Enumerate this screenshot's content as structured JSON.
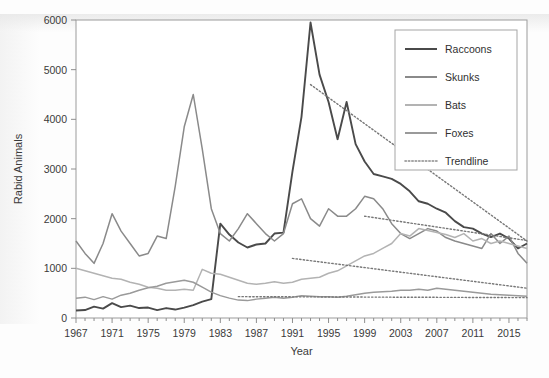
{
  "chart_data": {
    "type": "line",
    "title": "",
    "xlabel": "Year",
    "ylabel": "Rabid Animals",
    "xlim": [
      1967,
      2017
    ],
    "ylim": [
      0,
      6000
    ],
    "ytick_step": 1000,
    "xtick_step": 4,
    "grid": false,
    "legend_position": "top-right",
    "x": [
      1967,
      1968,
      1969,
      1970,
      1971,
      1972,
      1973,
      1974,
      1975,
      1976,
      1977,
      1978,
      1979,
      1980,
      1981,
      1982,
      1983,
      1984,
      1985,
      1986,
      1987,
      1988,
      1989,
      1990,
      1991,
      1992,
      1993,
      1994,
      1995,
      1996,
      1997,
      1998,
      1999,
      2000,
      2001,
      2002,
      2003,
      2004,
      2005,
      2006,
      2007,
      2008,
      2009,
      2010,
      2011,
      2012,
      2013,
      2014,
      2015,
      2016,
      2017
    ],
    "xticks": [
      1967,
      1971,
      1975,
      1979,
      1983,
      1987,
      1991,
      1995,
      1999,
      2003,
      2007,
      2011,
      2015
    ],
    "yticks": [
      0,
      1000,
      2000,
      3000,
      4000,
      5000,
      6000
    ],
    "series": [
      {
        "name": "Raccoons",
        "color": "#4a4a4a",
        "width": 1.9,
        "values": [
          150,
          160,
          230,
          190,
          300,
          220,
          250,
          200,
          210,
          160,
          200,
          170,
          210,
          260,
          330,
          380,
          1900,
          1680,
          1520,
          1420,
          1480,
          1500,
          1700,
          1720,
          2950,
          4050,
          5950,
          4900,
          4350,
          3600,
          4350,
          3500,
          3150,
          2900,
          2850,
          2800,
          2700,
          2550,
          2350,
          2300,
          2200,
          2120,
          1950,
          1830,
          1800,
          1700,
          1630,
          1700,
          1600,
          1400,
          1500
        ]
      },
      {
        "name": "Skunks",
        "color": "#8a8a8a",
        "width": 1.5,
        "values": [
          1550,
          1300,
          1100,
          1500,
          2100,
          1750,
          1500,
          1250,
          1300,
          1650,
          1600,
          2650,
          3850,
          4500,
          3400,
          2200,
          1700,
          1550,
          1800,
          2100,
          1900,
          1700,
          1550,
          1700,
          2300,
          2400,
          2000,
          1850,
          2200,
          2050,
          2050,
          2200,
          2450,
          2400,
          2200,
          1900,
          1700,
          1600,
          1700,
          1800,
          1750,
          1620,
          1550,
          1500,
          1450,
          1400,
          1700,
          1500,
          1650,
          1300,
          1100
        ]
      },
      {
        "name": "Bats",
        "color": "#b3b3b3",
        "width": 1.5,
        "values": [
          1000,
          950,
          900,
          850,
          800,
          780,
          720,
          680,
          620,
          600,
          560,
          560,
          580,
          560,
          980,
          900,
          880,
          820,
          760,
          700,
          680,
          700,
          730,
          700,
          720,
          780,
          800,
          820,
          900,
          950,
          1050,
          1150,
          1250,
          1300,
          1400,
          1500,
          1700,
          1650,
          1800,
          1760,
          1720,
          1680,
          1620,
          1700,
          1550,
          1600,
          1500,
          1550,
          1500,
          1450,
          1400
        ]
      },
      {
        "name": "Foxes",
        "color": "#9a9a9a",
        "width": 1.5,
        "values": [
          400,
          420,
          370,
          430,
          380,
          460,
          500,
          560,
          610,
          640,
          700,
          730,
          760,
          720,
          620,
          520,
          450,
          400,
          360,
          350,
          380,
          400,
          420,
          400,
          420,
          450,
          440,
          430,
          430,
          420,
          440,
          470,
          500,
          520,
          530,
          540,
          560,
          560,
          580,
          560,
          600,
          580,
          560,
          540,
          520,
          500,
          480,
          470,
          460,
          450,
          440
        ]
      }
    ],
    "trendlines": [
      {
        "for": "Raccoons",
        "x_start": 1993,
        "x_end": 2017,
        "y_start": 4700,
        "y_end": 1550
      },
      {
        "for": "Skunks",
        "x_start": 1999,
        "x_end": 2017,
        "y_start": 2050,
        "y_end": 1560
      },
      {
        "for": "Bats",
        "x_start": 1991,
        "x_end": 2017,
        "y_start": 1200,
        "y_end": 600
      },
      {
        "for": "Foxes",
        "x_start": 1985,
        "x_end": 2017,
        "y_start": 430,
        "y_end": 410
      }
    ],
    "legend": [
      {
        "label": "Raccoons",
        "color": "#4a4a4a",
        "style": "solid"
      },
      {
        "label": "Skunks",
        "color": "#8a8a8a",
        "style": "solid"
      },
      {
        "label": "Bats",
        "color": "#b3b3b3",
        "style": "solid"
      },
      {
        "label": "Foxes",
        "color": "#9a9a9a",
        "style": "solid"
      },
      {
        "label": "Trendline",
        "color": "#8a8a8a",
        "style": "dotted"
      }
    ]
  }
}
